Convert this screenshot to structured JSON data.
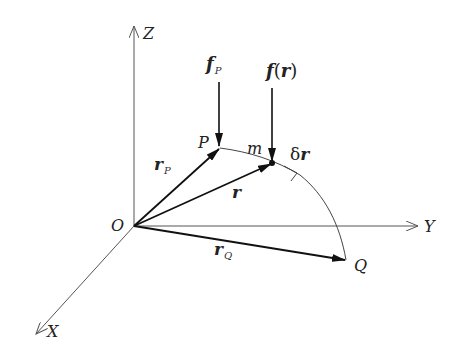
{
  "diagram": {
    "type": "3d-vector-work-diagram",
    "colors": {
      "line": "#222222",
      "axis": "#555555",
      "background": "#ffffff"
    },
    "axes": {
      "z": {
        "label": "Z"
      },
      "y": {
        "label": "Y"
      },
      "x": {
        "label": "X"
      },
      "origin": {
        "label": "O"
      }
    },
    "points": {
      "p": {
        "label": "P"
      },
      "m": {
        "label": "m"
      },
      "q": {
        "label": "Q"
      }
    },
    "vectors": {
      "r_p": {
        "main": "r",
        "sub": "P"
      },
      "r": {
        "main": "r"
      },
      "r_q": {
        "main": "r",
        "sub": "Q"
      },
      "f_p": {
        "main": "f",
        "sub": "P"
      },
      "f_r": {
        "main": "f",
        "open": "(",
        "arg": "r",
        "close": ")"
      },
      "delta_r": {
        "prefix": "δ",
        "main": "r"
      }
    }
  }
}
